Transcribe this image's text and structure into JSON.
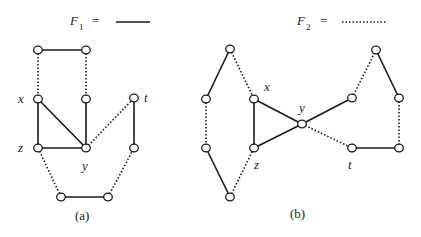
{
  "legend": {
    "f1": {
      "name": "F",
      "sub": "1",
      "eq": "=",
      "style": "solid"
    },
    "f2": {
      "name": "F",
      "sub": "2",
      "eq": "=",
      "style": "dotted"
    }
  },
  "panels": {
    "a": {
      "caption": "(a)",
      "labels": {
        "x": "x",
        "y": "y",
        "z": "z",
        "t": "t"
      },
      "nodes": {
        "tl": [
          38,
          50
        ],
        "tr": [
          86,
          50
        ],
        "x": [
          38,
          99
        ],
        "m": [
          86,
          99
        ],
        "t": [
          134,
          98
        ],
        "z": [
          38,
          148
        ],
        "y": [
          86,
          148
        ],
        "tb": [
          134,
          148
        ],
        "bl": [
          61,
          197
        ],
        "br": [
          108,
          197
        ]
      },
      "edges": [
        {
          "from": "tl",
          "to": "tr",
          "forest": "F1"
        },
        {
          "from": "tl",
          "to": "x",
          "forest": "F2"
        },
        {
          "from": "tr",
          "to": "m",
          "forest": "F2"
        },
        {
          "from": "x",
          "to": "z",
          "forest": "F1"
        },
        {
          "from": "x",
          "to": "y",
          "forest": "F1"
        },
        {
          "from": "m",
          "to": "y",
          "forest": "F1"
        },
        {
          "from": "z",
          "to": "y",
          "forest": "F1"
        },
        {
          "from": "y",
          "to": "t",
          "forest": "F2"
        },
        {
          "from": "t",
          "to": "tb",
          "forest": "F1"
        },
        {
          "from": "z",
          "to": "bl",
          "forest": "F2"
        },
        {
          "from": "bl",
          "to": "br",
          "forest": "F1"
        },
        {
          "from": "br",
          "to": "tb",
          "forest": "F2"
        }
      ]
    },
    "b": {
      "caption": "(b)",
      "labels": {
        "x": "x",
        "y": "y",
        "z": "z",
        "t": "t"
      },
      "nodes": {
        "top": [
          230,
          49
        ],
        "l1": [
          206,
          99
        ],
        "l2": [
          206,
          148
        ],
        "bot": [
          230,
          197
        ],
        "x": [
          254,
          99
        ],
        "z": [
          254,
          148
        ],
        "y": [
          302,
          124
        ],
        "r1": [
          352,
          98
        ],
        "rt": [
          376,
          50
        ],
        "rf": [
          399,
          98
        ],
        "t": [
          352,
          148
        ],
        "rb": [
          399,
          148
        ]
      },
      "edges": [
        {
          "from": "top",
          "to": "l1",
          "forest": "F1"
        },
        {
          "from": "l1",
          "to": "l2",
          "forest": "F2"
        },
        {
          "from": "l2",
          "to": "bot",
          "forest": "F1"
        },
        {
          "from": "bot",
          "to": "z",
          "forest": "F2"
        },
        {
          "from": "top",
          "to": "x",
          "forest": "F2"
        },
        {
          "from": "x",
          "to": "z",
          "forest": "F1"
        },
        {
          "from": "x",
          "to": "y",
          "forest": "F1"
        },
        {
          "from": "z",
          "to": "y",
          "forest": "F1"
        },
        {
          "from": "y",
          "to": "r1",
          "forest": "F1"
        },
        {
          "from": "r1",
          "to": "rt",
          "forest": "F2"
        },
        {
          "from": "rt",
          "to": "rf",
          "forest": "F1"
        },
        {
          "from": "rf",
          "to": "rb",
          "forest": "F2"
        },
        {
          "from": "y",
          "to": "t",
          "forest": "F2"
        },
        {
          "from": "t",
          "to": "rb",
          "forest": "F1"
        }
      ]
    }
  }
}
